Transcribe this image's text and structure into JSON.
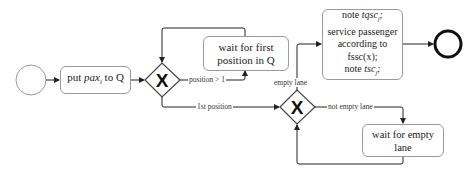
{
  "diagram": {
    "type": "BPMN process",
    "events": {
      "start": {
        "label": ""
      },
      "end": {
        "label": ""
      }
    },
    "tasks": {
      "put_pax": {
        "pre": "put ",
        "var": "pax",
        "sub": "i",
        "post": " to Q"
      },
      "wait_first": {
        "line1": "wait for first",
        "line2": "position in Q"
      },
      "service": {
        "line1_pre": "note ",
        "line1_var": "tqsc",
        "line1_sub": "j",
        "line1_post": ";",
        "line2": "service passenger",
        "line3": "according to",
        "line4": "fssc(x);",
        "line5_pre": "note ",
        "line5_var": "tsc",
        "line5_sub": "j",
        "line5_post": ";"
      },
      "wait_lane": {
        "label": "wait for empty lane"
      }
    },
    "gateways": {
      "g1": {
        "symbol": "X",
        "type": "exclusive"
      },
      "g2": {
        "symbol": "X",
        "type": "exclusive"
      }
    },
    "flows": {
      "position_gt_1": "position > 1",
      "first_position": "1st position",
      "empty_lane": "empty lane",
      "not_empty_lane": "not empty lane"
    }
  }
}
